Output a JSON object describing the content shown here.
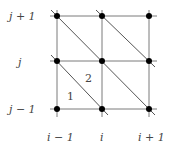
{
  "diagram": {
    "type": "triangulated-grid-stencil",
    "row_labels": [
      "j + 1",
      "j",
      "j − 1"
    ],
    "col_labels": [
      "i − 1",
      "i",
      "i + 1"
    ],
    "triangle_labels": [
      "1",
      "2"
    ],
    "colors": {
      "line": "#777777",
      "node": "#000000",
      "text": "#444444"
    }
  }
}
